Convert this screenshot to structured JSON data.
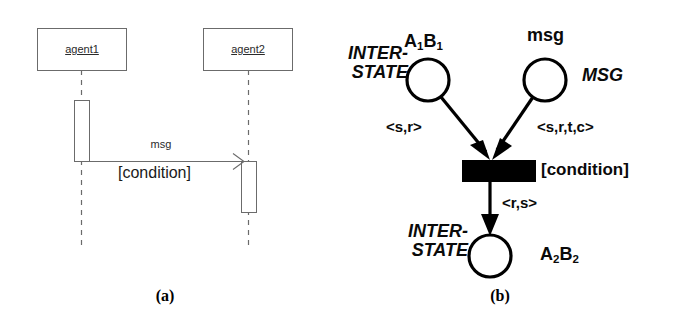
{
  "figure": {
    "captions": {
      "left": "(a)",
      "right": "(b)"
    }
  },
  "sequence_diagram": {
    "lifelines": [
      {
        "label": "agent1"
      },
      {
        "label": "agent2"
      }
    ],
    "message": {
      "name": "msg",
      "guard": "[condition]"
    }
  },
  "petri_net": {
    "places": [
      {
        "type_label": "INTER-",
        "type_label2": "STATE",
        "marking": "A",
        "marking_sub": "1",
        "marking2": "B",
        "marking2_sub": "1"
      },
      {
        "type_label": "MSG",
        "marking": "msg"
      },
      {
        "type_label": "INTER-",
        "type_label2": "STATE",
        "marking": "A",
        "marking_sub": "2",
        "marking2": "B",
        "marking2_sub": "2"
      }
    ],
    "transition": {
      "guard": "[condition]"
    },
    "arcs": [
      {
        "inscription": "<s,r>"
      },
      {
        "inscription": "<s,r,t,c>"
      },
      {
        "inscription": "<r,s>"
      }
    ]
  },
  "colors": {
    "stroke_light": "#6b6b6b",
    "stroke_dark": "#000000",
    "fill_transition": "#000000",
    "background": "#ffffff"
  }
}
